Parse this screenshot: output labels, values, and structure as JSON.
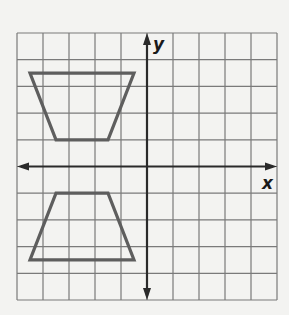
{
  "diagram": {
    "type": "coordinate-grid",
    "x_label": "x",
    "y_label": "y",
    "grid": {
      "x_min": -5,
      "x_max": 5,
      "y_min": -5,
      "y_max": 5,
      "step": 1
    },
    "shapes": [
      {
        "name": "trapezoid-upper",
        "vertices": [
          [
            -4.5,
            3.5
          ],
          [
            -0.5,
            3.5
          ],
          [
            -1.5,
            1
          ],
          [
            -3.5,
            1
          ]
        ]
      },
      {
        "name": "trapezoid-lower",
        "vertices": [
          [
            -3.5,
            -1
          ],
          [
            -1.5,
            -1
          ],
          [
            -0.5,
            -3.5
          ],
          [
            -4.5,
            -3.5
          ]
        ]
      }
    ],
    "colors": {
      "background": "#f3f3f1",
      "grid": "#7a7a7a",
      "axis": "#2a2a2a",
      "shape": "#5e5e5e"
    }
  }
}
